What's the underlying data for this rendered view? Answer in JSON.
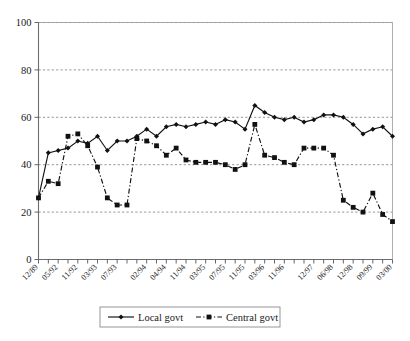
{
  "chart_data": {
    "type": "line",
    "title": "",
    "subtitle": "",
    "xlabel": "",
    "ylabel": "",
    "ylim": [
      0,
      100
    ],
    "yticks": [
      0,
      20,
      40,
      60,
      80,
      100
    ],
    "ytick_labels": [
      "0",
      "20",
      "40",
      "60",
      "80",
      "100"
    ],
    "grid": true,
    "grid_axis": "y",
    "legend_position": "bottom-center",
    "x_tick_labels": [
      "12/89",
      "05/92",
      "11/92",
      "03/93",
      "07/93",
      "02/94",
      "04/94",
      "11/94",
      "03/95",
      "07/95",
      "11/95",
      "03/96",
      "11/96",
      "12/97",
      "06/98",
      "12/98",
      "09/99",
      "03/00"
    ],
    "n_points": 37,
    "series": [
      {
        "name": "Local govt",
        "marker": "diamond",
        "linestyle": "solid",
        "color": "#111111",
        "values": [
          26,
          45,
          46,
          47,
          50,
          49,
          52,
          46,
          50,
          50,
          52,
          55,
          52,
          56,
          57,
          56,
          57,
          58,
          57,
          59,
          58,
          55,
          65,
          62,
          60,
          59,
          60,
          58,
          59,
          61,
          61,
          60,
          57,
          53,
          55,
          56,
          52
        ]
      },
      {
        "name": "Central govt",
        "marker": "square",
        "linestyle": "dashdot",
        "color": "#111111",
        "values": [
          26,
          33,
          32,
          52,
          53,
          48,
          39,
          26,
          23,
          23,
          51,
          50,
          48,
          44,
          47,
          42,
          41,
          41,
          41,
          40,
          38,
          40,
          57,
          44,
          43,
          41,
          40,
          47,
          47,
          47,
          44,
          25,
          22,
          20,
          28,
          19,
          16
        ]
      }
    ],
    "legend": [
      {
        "label": "Local govt",
        "marker": "diamond",
        "linestyle": "solid"
      },
      {
        "label": "Central govt",
        "marker": "square",
        "linestyle": "dashdot"
      }
    ]
  }
}
